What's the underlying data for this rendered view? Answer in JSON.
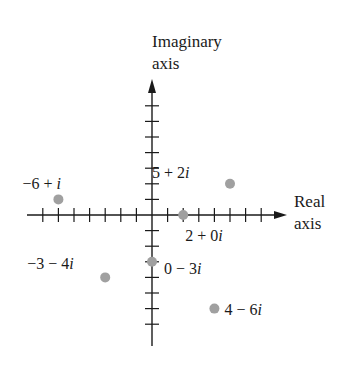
{
  "diagram": {
    "type": "complex-plane",
    "axes": {
      "imaginary_label_line1": "Imaginary",
      "imaginary_label_line2": "axis",
      "real_label_line1": "Real",
      "real_label_line2": "axis",
      "real_range": [
        -7,
        7
      ],
      "imag_range": [
        -7,
        7
      ]
    },
    "points": [
      {
        "re": -6,
        "im": 1,
        "label_parts": [
          "−6 + ",
          "i"
        ],
        "label_dx": -36,
        "label_dy": -10
      },
      {
        "re": 5,
        "im": 2,
        "label_parts": [
          "5 + 2",
          "i"
        ],
        "label_dx": -78,
        "label_dy": -6
      },
      {
        "re": 2,
        "im": 0,
        "label_parts": [
          "2 + 0",
          "i"
        ],
        "label_dx": 2,
        "label_dy": 26
      },
      {
        "re": -3,
        "im": -4,
        "label_parts": [
          "−3 − 4",
          "i"
        ],
        "label_dx": -78,
        "label_dy": -8
      },
      {
        "re": 0,
        "im": -3,
        "label_parts": [
          "0 − 3",
          "i"
        ],
        "label_dx": 12,
        "label_dy": 12
      },
      {
        "re": 4,
        "im": -6,
        "label_parts": [
          "4 − 6",
          "i"
        ],
        "label_dx": 10,
        "label_dy": 6
      }
    ],
    "colors": {
      "axis": "#1a1a1a",
      "point": "#a0a0a0"
    }
  }
}
